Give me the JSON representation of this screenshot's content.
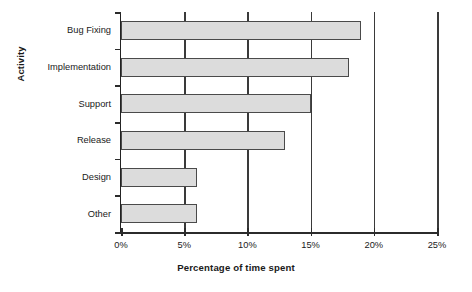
{
  "chart_data": {
    "type": "bar",
    "orientation": "horizontal",
    "title": "",
    "xlabel": "Percentage of time spent",
    "ylabel": "Activity",
    "categories": [
      "Bug Fixing",
      "Implementation",
      "Support",
      "Release",
      "Design",
      "Other"
    ],
    "values": [
      19,
      18,
      15,
      13,
      6,
      6
    ],
    "xlim": [
      0,
      25
    ],
    "xticks": [
      0,
      5,
      10,
      15,
      20,
      25
    ],
    "xticklabels": [
      "0%",
      "5%",
      "10%",
      "15%",
      "20%",
      "25%"
    ],
    "grid": "vertical",
    "legend": "none",
    "bar_fill_color": "#dcdcdc",
    "bar_border_color": "#4a4a4a",
    "axis_color": "#2b2b2b",
    "background_color": "#ffffff"
  }
}
